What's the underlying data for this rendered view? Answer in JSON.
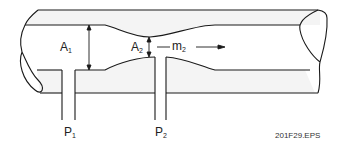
{
  "diagram": {
    "labels": {
      "a1": {
        "main": "A",
        "sub": "1"
      },
      "a2": {
        "main": "A",
        "sub": "2"
      },
      "m2": {
        "main": "m",
        "sub": "2"
      },
      "p1": {
        "main": "P",
        "sub": "1"
      },
      "p2": {
        "main": "P",
        "sub": "2"
      }
    },
    "figure_id": "201F29.EPS",
    "colors": {
      "line": "#1a1a1a",
      "fill": "#f4f4f4",
      "background": "#ffffff"
    }
  }
}
